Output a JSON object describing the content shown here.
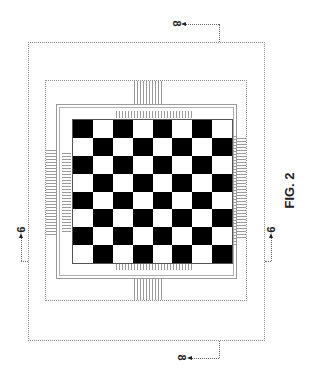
{
  "figure": {
    "label": "FIG. 2",
    "section_markers": {
      "top": "8",
      "bottom": "8",
      "left": "9",
      "right": "9"
    }
  },
  "board": {
    "rows": 8,
    "cols": 8,
    "first_cell": "black",
    "colors": {
      "dark": "#000000",
      "light": "#ffffff"
    }
  },
  "colors": {
    "line": "#8a8a8a",
    "hatch": "#9a9a9a",
    "text": "#222222"
  }
}
